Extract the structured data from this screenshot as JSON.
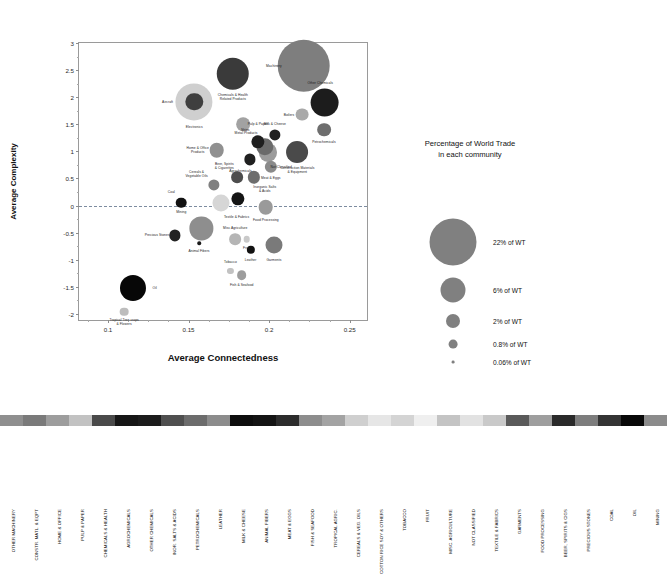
{
  "chart_data": {
    "type": "scatter",
    "title": "",
    "xlabel": "Average Connectedness",
    "ylabel": "Average Complexity",
    "xlim": [
      0.082,
      0.262
    ],
    "ylim": [
      -2.15,
      3.0
    ],
    "xticks": [
      0.1,
      0.15,
      0.2,
      0.25
    ],
    "xticklabels": [
      "0.1",
      "0.15",
      "0.2",
      "0.25"
    ],
    "yticks": [
      -2,
      -1.5,
      -1,
      -0.5,
      0,
      0.5,
      1,
      1.5,
      2,
      2.5,
      3
    ],
    "yticklabels": [
      "-2",
      "-1.5",
      "-1",
      "-0.5",
      "0",
      "0.5",
      "1",
      "1.5",
      "2",
      "2.5",
      "3"
    ],
    "grid": false,
    "reference_line_y": 0,
    "size_meaning": "Percentage of World Trade in each community",
    "points": [
      {
        "label": "Machinery",
        "x": 0.2215,
        "y": 2.58,
        "size": 22.0,
        "color": "#7e7e7e",
        "lx": -0.0185,
        "ly": 0.0
      },
      {
        "label": "Other Chemicals",
        "x": 0.2345,
        "y": 1.9,
        "size": 6.6,
        "color": "#1c1c1c",
        "lx": -0.0028,
        "ly": 0.4
      },
      {
        "label": "Chemicals & Health\nRelated Products",
        "x": 0.1775,
        "y": 2.43,
        "size": 8.4,
        "color": "#3a3a3a",
        "lx": 0.0,
        "ly": -0.52
      },
      {
        "label": "Aircraft",
        "x": 0.1535,
        "y": 1.92,
        "size": 2.4,
        "color": "#3f3f3f",
        "lx": -0.0165,
        "ly": 0.0
      },
      {
        "label": "Electronics",
        "x": 0.1535,
        "y": 1.92,
        "size": 11.0,
        "color": "#cfcfcf",
        "lx": 0.0,
        "ly": -0.56
      },
      {
        "label": "Boilers",
        "x": 0.2205,
        "y": 1.68,
        "size": 1.3,
        "color": "#a9a9a9",
        "lx": -0.0082,
        "ly": 0.0
      },
      {
        "label": "Petrochemicals",
        "x": 0.234,
        "y": 1.4,
        "size": 1.5,
        "color": "#6e6e6e",
        "lx": 0.0,
        "ly": -0.22
      },
      {
        "label": "Pulp & Paper",
        "x": 0.184,
        "y": 1.5,
        "size": 1.5,
        "color": "#a2a2a2",
        "lx": 0.009,
        "ly": 0.0
      },
      {
        "label": "Milk & Cheese",
        "x": 0.2035,
        "y": 1.3,
        "size": 1.0,
        "color": "#202020",
        "lx": 0.0,
        "ly": 0.2
      },
      {
        "label": "Ships",
        "x": 0.193,
        "y": 1.18,
        "size": 1.4,
        "color": "#1e1e1e",
        "lx": -0.0078,
        "ly": 0.07
      },
      {
        "label": "Metal Products",
        "x": 0.1975,
        "y": 1.08,
        "size": 2.4,
        "color": "#6a6a6a",
        "lx": -0.0118,
        "ly": 0.02
      },
      {
        "label": "Not Classified",
        "x": 0.199,
        "y": 0.98,
        "size": 2.6,
        "color": "#9b9b9b",
        "lx": 0.0085,
        "ly": -0.12
      },
      {
        "label": "Home & Office\nProducts",
        "x": 0.1675,
        "y": 1.02,
        "size": 1.7,
        "color": "#909090",
        "lx": -0.0118,
        "ly": 0.0
      },
      {
        "label": "Construction Materials\n& Equipment",
        "x": 0.2175,
        "y": 0.98,
        "size": 3.8,
        "color": "#4a4a4a",
        "lx": 0.0,
        "ly": -0.42
      },
      {
        "label": "Agrochemicals",
        "x": 0.188,
        "y": 0.85,
        "size": 1.0,
        "color": "#202020",
        "lx": -0.0058,
        "ly": -0.16
      },
      {
        "label": "Meat & Eggs",
        "x": 0.201,
        "y": 0.72,
        "size": 1.2,
        "color": "#8a8a8a",
        "lx": 0.0,
        "ly": -0.22
      },
      {
        "label": "Beer, Spirits\n& Cigarettes",
        "x": 0.18,
        "y": 0.52,
        "size": 1.1,
        "color": "#4d4d4d",
        "lx": -0.0078,
        "ly": 0.07
      },
      {
        "label": "Inorganic Salts\n& Acids",
        "x": 0.1905,
        "y": 0.52,
        "size": 1.2,
        "color": "#6d6d6d",
        "lx": 0.0068,
        "ly": -0.18
      },
      {
        "label": "Cereals &\nVegetable Oils",
        "x": 0.1655,
        "y": 0.38,
        "size": 1.0,
        "color": "#808080",
        "lx": -0.0105,
        "ly": 0.07
      },
      {
        "label": "Textile & Fabrics",
        "x": 0.17,
        "y": 0.05,
        "size": 2.3,
        "color": "#d6d6d6",
        "lx": 0.0098,
        "ly": -0.04
      },
      {
        "label": "",
        "x": 0.1805,
        "y": 0.12,
        "size": 1.4,
        "color": "#151515",
        "lx": 0.0,
        "ly": 0.0
      },
      {
        "label": "Coal",
        "x": 0.1455,
        "y": 0.05,
        "size": 0.9,
        "color": "#121212",
        "lx": -0.0062,
        "ly": 0.12
      },
      {
        "label": "Food Processing",
        "x": 0.198,
        "y": -0.03,
        "size": 1.7,
        "color": "#9a9a9a",
        "lx": 0.0,
        "ly": -0.24
      },
      {
        "label": "Mining",
        "x": 0.158,
        "y": -0.42,
        "size": 4.3,
        "color": "#8e8e8e",
        "lx": -0.0125,
        "ly": 0.13
      },
      {
        "label": "Precious Stones",
        "x": 0.1415,
        "y": -0.55,
        "size": 1.0,
        "color": "#232323",
        "lx": -0.011,
        "ly": 0.0
      },
      {
        "label": "Animal Fibers",
        "x": 0.1565,
        "y": -0.7,
        "size": 0.1,
        "color": "#1a1a1a",
        "lx": 0.0,
        "ly": -0.16
      },
      {
        "label": "Misc Agriculture",
        "x": 0.179,
        "y": -0.62,
        "size": 1.1,
        "color": "#b5b5b5",
        "lx": 0.0,
        "ly": 0.22
      },
      {
        "label": "Fruit",
        "x": 0.186,
        "y": -0.62,
        "size": 0.35,
        "color": "#c9c9c9",
        "lx": 0.0,
        "ly": -0.2
      },
      {
        "label": "Leather",
        "x": 0.1885,
        "y": -0.82,
        "size": 0.55,
        "color": "#121212",
        "lx": 0.0,
        "ly": -0.22
      },
      {
        "label": "Garments",
        "x": 0.203,
        "y": -0.72,
        "size": 2.3,
        "color": "#7a7a7a",
        "lx": 0.0,
        "ly": -0.4
      },
      {
        "label": "Tobacco",
        "x": 0.176,
        "y": -1.2,
        "size": 0.3,
        "color": "#c2c2c2",
        "lx": 0.0,
        "ly": 0.22
      },
      {
        "label": "Fish & Seafood",
        "x": 0.183,
        "y": -1.28,
        "size": 0.75,
        "color": "#9d9d9d",
        "lx": 0.0,
        "ly": -0.26
      },
      {
        "label": "Oil",
        "x": 0.1155,
        "y": -1.52,
        "size": 5.4,
        "color": "#070707",
        "lx": 0.0135,
        "ly": 0.0
      },
      {
        "label": "Tropical Tree crops\n& Flowers",
        "x": 0.11,
        "y": -1.96,
        "size": 0.6,
        "color": "#bdbdbd",
        "lx": 0.0,
        "ly": -0.3
      }
    ]
  },
  "legend": {
    "title": "Percentage of World Trade\nin each community",
    "title_line1": "Percentage of World Trade",
    "title_line2": "in each community",
    "items": [
      {
        "label": "22% of WT",
        "r": 23.5
      },
      {
        "label": "6% of WT",
        "r": 12.5
      },
      {
        "label": "2% of WT",
        "r": 7.0
      },
      {
        "label": "0.8% of WT",
        "r": 4.4
      },
      {
        "label": "0.06% of WT",
        "r": 1.4
      }
    ]
  },
  "color_strip": {
    "cells": [
      {
        "label": "OTHER MACHINERY",
        "color": "#8f8f8f"
      },
      {
        "label": "CONSTR. MATL. & EQPT",
        "color": "#7a7a7a"
      },
      {
        "label": "HOME & OFFICE",
        "color": "#9d9d9d"
      },
      {
        "label": "PULP & PAPER",
        "color": "#c2c2c2"
      },
      {
        "label": "CHEMICALS & HEALTH",
        "color": "#4a4a4a"
      },
      {
        "label": "AGROCHEMICALS",
        "color": "#161616"
      },
      {
        "label": "OTHER CHEMICALS",
        "color": "#1c1c1c"
      },
      {
        "label": "INOR. SALTS & ACIDS",
        "color": "#4f4f4f"
      },
      {
        "label": "PETROCHEMICALS",
        "color": "#6c6c6c"
      },
      {
        "label": "LEATHER",
        "color": "#8c8c8c"
      },
      {
        "label": "MILK & CHEESE",
        "color": "#0e0e0e"
      },
      {
        "label": "ANIMAL FIBERS",
        "color": "#141414"
      },
      {
        "label": "MEAT & EGGS",
        "color": "#2c2c2c"
      },
      {
        "label": "FISH & SEAFOOD",
        "color": "#8d8d8d"
      },
      {
        "label": "TROPICAL AGRIC.",
        "color": "#a3a3a3"
      },
      {
        "label": "CEREALS & VEG. OILS",
        "color": "#cfcfcf"
      },
      {
        "label": "COTTON RICE SOY & OTHERS",
        "color": "#e6e6e6"
      },
      {
        "label": "TOBACCO",
        "color": "#d4d4d4"
      },
      {
        "label": "FRUIT",
        "color": "#efefef"
      },
      {
        "label": "MISC. AGRICULTURE",
        "color": "#c4c4c4"
      },
      {
        "label": "NOT CLASSIFIED",
        "color": "#e2e2e2"
      },
      {
        "label": "TEXTILE & FABRICS",
        "color": "#c9c9c9"
      },
      {
        "label": "GARMENTS",
        "color": "#5a5a5a"
      },
      {
        "label": "FOOD PROCESSING",
        "color": "#9e9e9e"
      },
      {
        "label": "BEER, SPIRITS & CIGS",
        "color": "#2a2a2a"
      },
      {
        "label": "PRECIOUS STONES",
        "color": "#7d7d7d"
      },
      {
        "label": "COAL",
        "color": "#343434"
      },
      {
        "label": "OIL",
        "color": "#080808"
      },
      {
        "label": "MINING",
        "color": "#8b8b8b"
      }
    ]
  }
}
